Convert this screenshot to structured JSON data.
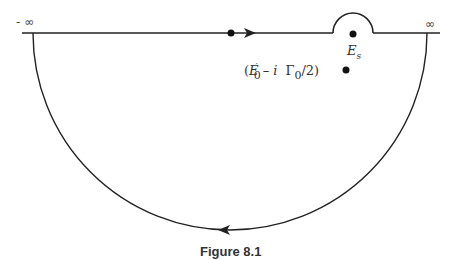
{
  "figure": {
    "caption": "Figure 8.1",
    "labels": {
      "neg_infinity": "- ∞",
      "pos_infinity": "∞",
      "threshold": "E",
      "threshold_sub": "s",
      "pole_open": "(",
      "pole_E": "E",
      "pole_prime": "′",
      "pole_E_sub": "0",
      "pole_minus_i": "– i",
      "pole_gamma": "Γ",
      "pole_gamma_sub": "0",
      "pole_over2": "/2",
      "pole_close": ")"
    },
    "colors": {
      "stroke": "#222222",
      "background": "#ffffff"
    },
    "contour": {
      "real_axis": {
        "x_start": 22,
        "x_end": 440,
        "y": 33
      },
      "semicircle": {
        "cx": 230,
        "cy": 33,
        "r": 197
      },
      "indentation": {
        "cx": 353,
        "cy": 33,
        "r": 20
      },
      "arrow_top_x": 250,
      "arrow_bottom_x": 225
    },
    "points": {
      "origin_dot": {
        "x": 231,
        "y": 33
      },
      "threshold_dot": {
        "x": 353,
        "y": 34
      },
      "pole_dot": {
        "x": 346,
        "y": 70
      }
    }
  }
}
